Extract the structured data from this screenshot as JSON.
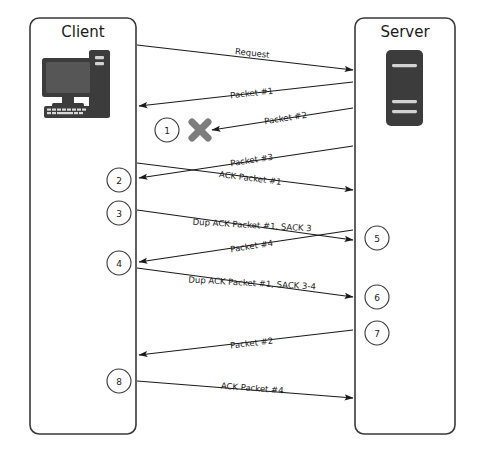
{
  "diagram": {
    "background_color": "#ffffff",
    "line_color": "#1a1a1a",
    "box_stroke_color": "#3a3a3a",
    "drop_marker_color": "#7d7d7d"
  },
  "endpoints": [
    {
      "id": "client",
      "label": "Client",
      "icon": "desktop-computer-icon",
      "x": 30,
      "y": 18,
      "width": 106,
      "height": 416
    },
    {
      "id": "server",
      "label": "Server",
      "icon": "server-tower-icon",
      "x": 355,
      "y": 18,
      "width": 100,
      "height": 416
    }
  ],
  "messages": [
    {
      "id": "m1",
      "label": "Request",
      "direction": "client-to-server",
      "x1": 137,
      "y1": 45,
      "x2": 353,
      "y2": 70,
      "label_x": 252,
      "label_y": 56
    },
    {
      "id": "m2",
      "label": "Packet #1",
      "direction": "server-to-client",
      "x1": 353,
      "y1": 82,
      "x2": 139,
      "y2": 106,
      "label_x": 252,
      "label_y": 96
    },
    {
      "id": "m3",
      "label": "Packet #2",
      "direction": "server-to-client",
      "x1": 353,
      "y1": 108,
      "x2": 212,
      "y2": 130,
      "label_x": 286,
      "label_y": 121,
      "dropped": true
    },
    {
      "id": "m4",
      "label": "Packet #3",
      "direction": "server-to-client",
      "x1": 353,
      "y1": 146,
      "x2": 139,
      "y2": 178,
      "label_x": 252,
      "label_y": 163
    },
    {
      "id": "m5",
      "label": "ACK Packet #1",
      "direction": "client-to-server",
      "x1": 137,
      "y1": 163,
      "x2": 353,
      "y2": 190,
      "label_x": 250,
      "label_y": 181
    },
    {
      "id": "m6",
      "label": "Dup ACK Packet #1, SACK 3",
      "direction": "client-to-server",
      "x1": 137,
      "y1": 210,
      "x2": 353,
      "y2": 240,
      "label_x": 252,
      "label_y": 228
    },
    {
      "id": "m7",
      "label": "Packet #4",
      "direction": "server-to-client",
      "x1": 353,
      "y1": 230,
      "x2": 139,
      "y2": 262,
      "label_x": 252,
      "label_y": 249
    },
    {
      "id": "m8",
      "label": "Dup ACK Packet #1, SACK 3-4",
      "direction": "client-to-server",
      "x1": 137,
      "y1": 268,
      "x2": 353,
      "y2": 297,
      "label_x": 252,
      "label_y": 286
    },
    {
      "id": "m9",
      "label": "Packet #2",
      "direction": "server-to-client",
      "x1": 353,
      "y1": 330,
      "x2": 139,
      "y2": 355,
      "label_x": 252,
      "label_y": 346
    },
    {
      "id": "m10",
      "label": "ACK Packet #4",
      "direction": "client-to-server",
      "x1": 137,
      "y1": 381,
      "x2": 353,
      "y2": 398,
      "label_x": 252,
      "label_y": 391
    }
  ],
  "steps": [
    {
      "number": "1",
      "side": "client",
      "x": 167,
      "y": 130
    },
    {
      "number": "2",
      "side": "client",
      "x": 119,
      "y": 180
    },
    {
      "number": "3",
      "side": "client",
      "x": 119,
      "y": 213
    },
    {
      "number": "4",
      "side": "client",
      "x": 119,
      "y": 263
    },
    {
      "number": "5",
      "side": "server",
      "x": 377,
      "y": 238
    },
    {
      "number": "6",
      "side": "server",
      "x": 377,
      "y": 297
    },
    {
      "number": "7",
      "side": "server",
      "x": 377,
      "y": 333
    },
    {
      "number": "8",
      "side": "client",
      "x": 119,
      "y": 381
    }
  ],
  "drop_marker": {
    "name": "packet-loss-x-icon",
    "x": 200,
    "y": 130,
    "size": 11
  }
}
